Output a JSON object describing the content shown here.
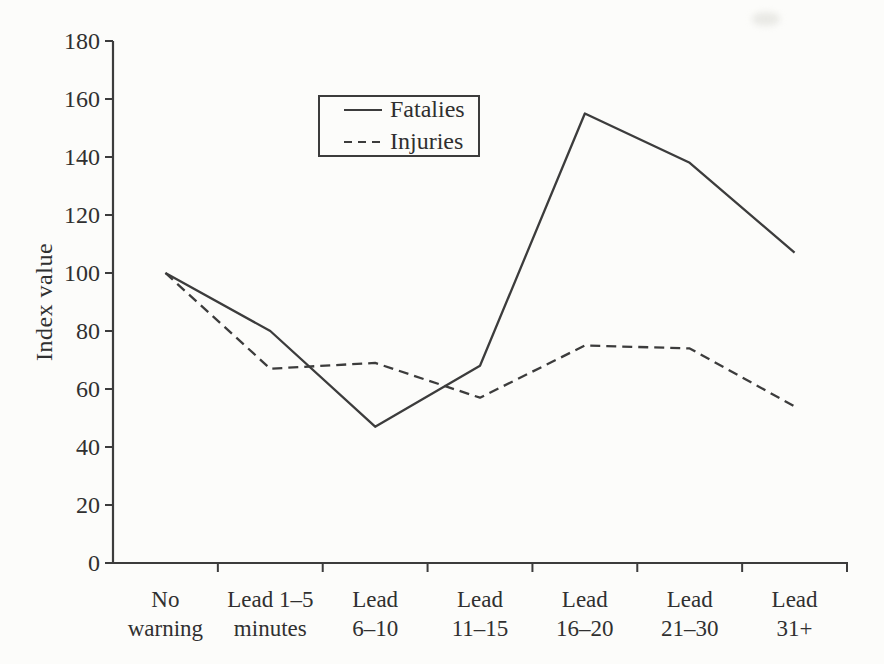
{
  "chart_data": {
    "type": "line",
    "title": "",
    "xlabel": "",
    "ylabel": "Index value",
    "ylim": [
      0,
      180
    ],
    "ytick_step": 20,
    "grid": false,
    "legend_position": "inside-top-center",
    "ink_color": "#3c3c3c",
    "text_color": "#303030",
    "background_color": "#fcfcfa",
    "categories": [
      "No warning",
      "Lead 1–5 minutes",
      "Lead 6–10",
      "Lead 11–15",
      "Lead 16–20",
      "Lead 21–30",
      "Lead 31+"
    ],
    "category_label_lines": [
      [
        "No",
        "warning"
      ],
      [
        "Lead 1–5",
        "minutes"
      ],
      [
        "Lead",
        "6–10"
      ],
      [
        "Lead",
        "11–15"
      ],
      [
        "Lead",
        "16–20"
      ],
      [
        "Lead",
        "21–30"
      ],
      [
        "Lead",
        "31+"
      ]
    ],
    "series": [
      {
        "name": "Fatalies",
        "line_style": "solid",
        "values": [
          100,
          80,
          47,
          68,
          155,
          138,
          107
        ]
      },
      {
        "name": "Injuries",
        "line_style": "dashed",
        "values": [
          100,
          67,
          69,
          57,
          75,
          74,
          54
        ]
      }
    ]
  }
}
